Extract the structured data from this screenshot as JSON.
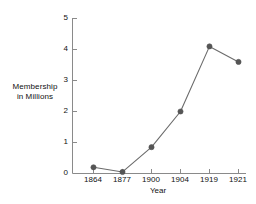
{
  "chart_data": {
    "type": "line",
    "title": "",
    "subtitle": "",
    "xlabel": "Year",
    "ylabel": "Membership in Millions",
    "ylabel_lines": [
      "Membership",
      "in Millions"
    ],
    "categories": [
      "1864",
      "1877",
      "1900",
      "1904",
      "1919",
      "1921"
    ],
    "values": [
      0.2,
      0.05,
      0.85,
      2.0,
      4.1,
      3.6
    ],
    "series": [
      {
        "name": "Membership",
        "values": [
          0.2,
          0.05,
          0.85,
          2.0,
          4.1,
          3.6
        ]
      }
    ],
    "ylim": [
      0,
      5
    ],
    "yticks": [
      "0",
      "1",
      "2",
      "3",
      "4",
      "5"
    ],
    "ytick_values": [
      0,
      1,
      2,
      3,
      4,
      5
    ],
    "xticks": [
      "1864",
      "1877",
      "1900",
      "1904",
      "1919",
      "1921"
    ],
    "grid": false,
    "legend": false,
    "legend_position": "none",
    "marker": "circle",
    "line_color": "#6b6b6b",
    "marker_color": "#555555",
    "axis_color": "#8a8a8a",
    "text_color": "#111111",
    "background_color": "#ffffff"
  }
}
